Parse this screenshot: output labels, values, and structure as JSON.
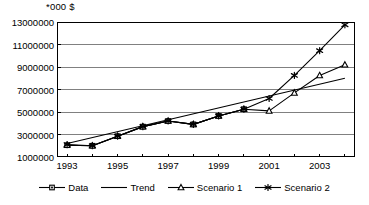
{
  "chart_data": {
    "type": "line",
    "title": "*000 $",
    "xlabel": "",
    "ylabel": "",
    "x": [
      1993,
      1994,
      1995,
      1996,
      1997,
      1998,
      1999,
      2000,
      2001,
      2002,
      2003,
      2004
    ],
    "xlim": [
      1992.6,
      2004.4
    ],
    "ylim": [
      1000000,
      13000000
    ],
    "ytick_values": [
      1000000,
      3000000,
      5000000,
      7000000,
      9000000,
      11000000,
      13000000
    ],
    "ytick_labels": [
      "1000000",
      "3000000",
      "5000000",
      "7000000",
      "9000000",
      "11000000",
      "13000000"
    ],
    "xtick_values": [
      1993,
      1995,
      1997,
      1999,
      2001,
      2003
    ],
    "xtick_labels": [
      "1993",
      "1995",
      "1997",
      "1999",
      "2001",
      "2003"
    ],
    "grid": "horizontal",
    "legend_position": "bottom",
    "series": [
      {
        "name": "Data",
        "marker": "square",
        "x": [
          1993,
          1994,
          1995,
          1996,
          1997,
          1998,
          1999,
          2000
        ],
        "values": [
          2050000,
          2000000,
          2850000,
          3700000,
          4200000,
          3900000,
          4650000,
          5250000
        ]
      },
      {
        "name": "Trend",
        "marker": "none",
        "x": [
          1993,
          2004
        ],
        "values": [
          2200000,
          8000000
        ]
      },
      {
        "name": "Scenario 1",
        "marker": "triangle",
        "x": [
          1993,
          1994,
          1995,
          1996,
          1997,
          1998,
          1999,
          2000,
          2001,
          2002,
          2003,
          2004
        ],
        "values": [
          2050000,
          2000000,
          2850000,
          3700000,
          4200000,
          3900000,
          4650000,
          5250000,
          5100000,
          6700000,
          8250000,
          9200000
        ]
      },
      {
        "name": "Scenario 2",
        "marker": "asterisk",
        "x": [
          1993,
          1994,
          1995,
          1996,
          1997,
          1998,
          1999,
          2000,
          2001,
          2002,
          2003,
          2004
        ],
        "values": [
          2100000,
          2000000,
          2850000,
          3700000,
          4200000,
          3900000,
          4650000,
          5250000,
          6200000,
          8250000,
          10450000,
          12750000
        ]
      }
    ],
    "colors": {
      "axis": "#000000",
      "grid": "#808080",
      "series": "#000000",
      "background": "#ffffff"
    }
  },
  "legend": {
    "items": [
      {
        "label": "Data",
        "marker": "square"
      },
      {
        "label": "Trend",
        "marker": "none"
      },
      {
        "label": "Scenario 1",
        "marker": "triangle"
      },
      {
        "label": "Scenario 2",
        "marker": "asterisk"
      }
    ]
  }
}
